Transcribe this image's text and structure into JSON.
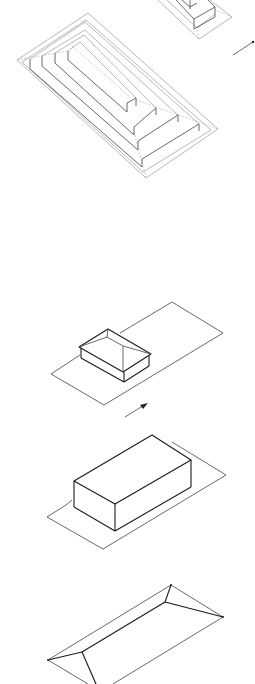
{
  "figure": {
    "background_color": "#ffffff",
    "line_color": "#1a1a1a",
    "panels": [
      {
        "id": "stepped-pyramid-partial",
        "label": "Partial stepped pyramid (cropped, top right)"
      },
      {
        "id": "stepped-pyramid",
        "label": "Stepped pyramid with five terraces"
      },
      {
        "id": "hip-roof-house-on-lot",
        "label": "Small hip-roof house on rectangular lot"
      },
      {
        "id": "box-on-lot",
        "label": "Rectangular box volume on lot"
      },
      {
        "id": "hip-roof",
        "label": "Large hip roof form (cropped, bottom)"
      }
    ],
    "arrows": [
      {
        "id": "direction-arrow-top",
        "direction": "north-east"
      },
      {
        "id": "direction-arrow-middle",
        "direction": "north-east"
      }
    ]
  }
}
